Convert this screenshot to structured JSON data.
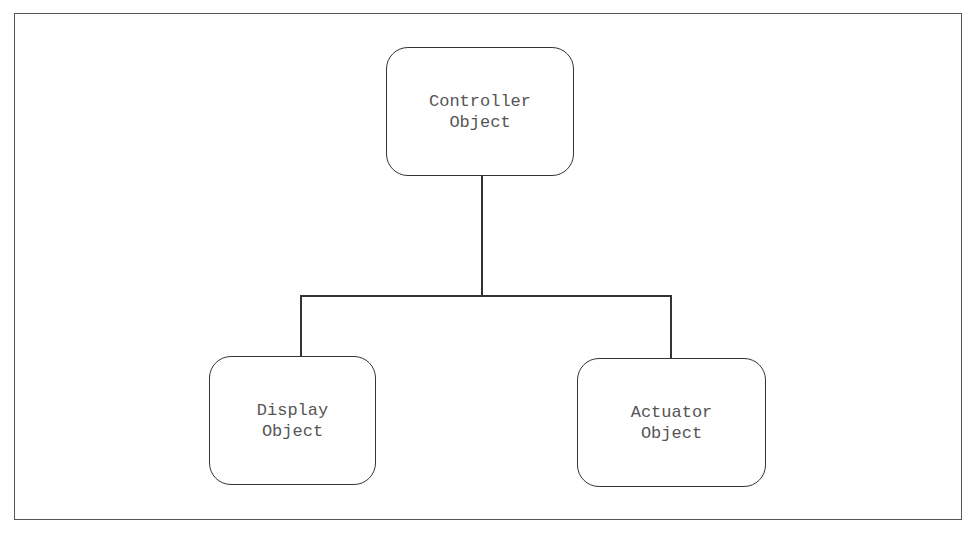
{
  "diagram": {
    "type": "hierarchy",
    "nodes": {
      "controller": {
        "line1": "Controller",
        "line2": "Object"
      },
      "display": {
        "line1": "Display",
        "line2": "Object"
      },
      "actuator": {
        "line1": "Actuator",
        "line2": "Object"
      }
    },
    "edges": [
      {
        "from": "controller",
        "to": "display"
      },
      {
        "from": "controller",
        "to": "actuator"
      }
    ],
    "colors": {
      "stroke": "#333333",
      "text": "#555555",
      "background": "#ffffff"
    }
  }
}
